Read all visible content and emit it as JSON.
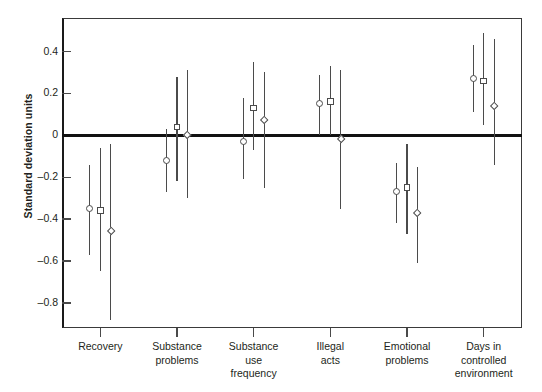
{
  "chart_data": {
    "type": "scatter",
    "title": "",
    "xlabel": "",
    "ylabel": "Standard deviation units",
    "ylim": [
      -0.92,
      0.56
    ],
    "yticks": [
      0.4,
      0.2,
      0,
      -0.2,
      -0.4,
      -0.6,
      -0.8
    ],
    "ytick_labels": [
      "0.4",
      "0.2",
      "0",
      "-0.2",
      "-0.4",
      "-0.6",
      "-0.8"
    ],
    "grid": false,
    "legend": "none",
    "zero_reference_line": 0,
    "categories": [
      "Recovery",
      "Substance problems",
      "Substance use frequency",
      "Illegal acts",
      "Emotional problems",
      "Days in controlled environment"
    ],
    "category_label_lines": [
      [
        "Recovery"
      ],
      [
        "Substance",
        "problems"
      ],
      [
        "Substance",
        "use",
        "frequency"
      ],
      [
        "Illegal",
        "acts"
      ],
      [
        "Emotional",
        "problems"
      ],
      [
        "Days in",
        "controlled",
        "environment"
      ]
    ],
    "series": [
      {
        "name": "series-1",
        "marker": "circle",
        "values": [
          -0.35,
          -0.12,
          -0.03,
          0.15,
          -0.27,
          0.27
        ],
        "ci_low": [
          -0.57,
          -0.27,
          -0.21,
          0.0,
          -0.42,
          0.11
        ],
        "ci_high": [
          -0.14,
          0.03,
          0.18,
          0.29,
          -0.13,
          0.43
        ]
      },
      {
        "name": "series-2",
        "marker": "square",
        "values": [
          -0.36,
          0.04,
          0.13,
          0.16,
          -0.25,
          0.26
        ],
        "ci_low": [
          -0.65,
          -0.22,
          -0.07,
          0.0,
          -0.47,
          0.05
        ],
        "ci_high": [
          -0.06,
          0.28,
          0.35,
          0.33,
          -0.04,
          0.49
        ]
      },
      {
        "name": "series-3",
        "marker": "diamond",
        "values": [
          -0.46,
          0.0,
          0.07,
          -0.02,
          -0.37,
          0.14
        ],
        "ci_low": [
          -0.88,
          -0.3,
          -0.25,
          -0.35,
          -0.61,
          -0.14
        ],
        "ci_high": [
          -0.04,
          0.31,
          0.3,
          0.31,
          -0.15,
          0.46
        ]
      }
    ],
    "colors": {
      "axis": "#3a3a3a",
      "zero_line": "#111111",
      "marker_stroke": "#4b4b4b",
      "marker_fill": "#ffffff",
      "text": "#231f20"
    }
  }
}
